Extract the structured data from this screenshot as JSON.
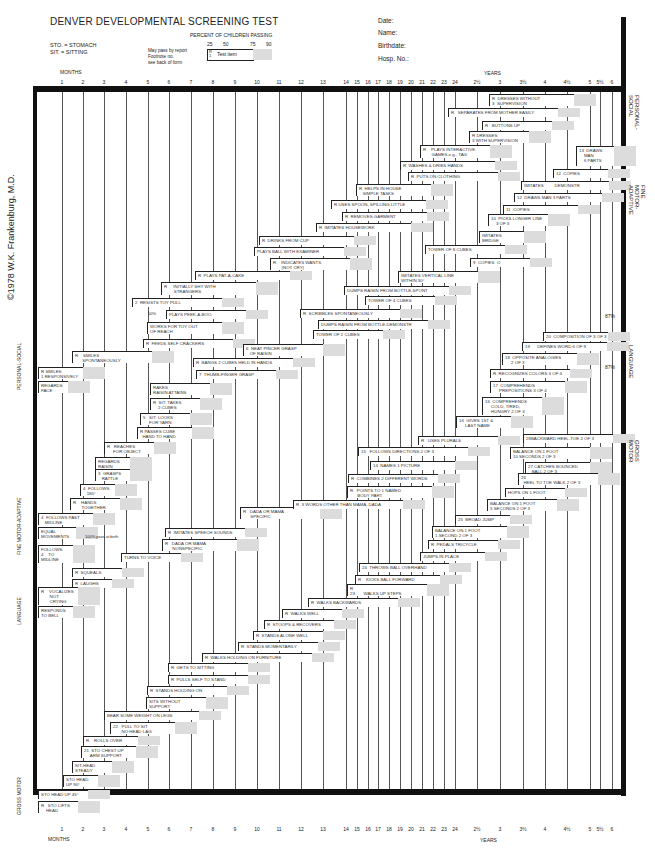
{
  "form": {
    "title": "DENVER DEVELOPMENTAL SCREENING TEST",
    "abbrev": [
      "STO. = STOMACH",
      "SIT. = SITTING"
    ],
    "percent_title": "PERCENT OF CHILDREN PASSING",
    "percent_ticks": [
      "25",
      "50",
      "75",
      "90"
    ],
    "key_notes": [
      "May pass by report",
      "Footnote no.",
      "see back of form"
    ],
    "key_label": "Test item",
    "key_r": "R",
    "key_num": "1",
    "fields": [
      "Date:",
      "Name:",
      "Birthdate:",
      "Hosp. No.:"
    ],
    "copyright": "©1978 W.K. Frankenburg, M.D."
  },
  "axis": {
    "months_label": "MONTHS",
    "years_label": "YEARS",
    "ticks": [
      {
        "label": "1",
        "x": 62
      },
      {
        "label": "2",
        "x": 83
      },
      {
        "label": "3",
        "x": 104
      },
      {
        "label": "4",
        "x": 126
      },
      {
        "label": "5",
        "x": 148
      },
      {
        "label": "6",
        "x": 169
      },
      {
        "label": "7",
        "x": 191
      },
      {
        "label": "8",
        "x": 213
      },
      {
        "label": "9",
        "x": 235
      },
      {
        "label": "10",
        "x": 257
      },
      {
        "label": "11",
        "x": 279
      },
      {
        "label": "12",
        "x": 301
      },
      {
        "label": "13",
        "x": 323
      },
      {
        "label": "14",
        "x": 346
      },
      {
        "label": "15",
        "x": 357
      },
      {
        "label": "16",
        "x": 368
      },
      {
        "label": "17",
        "x": 378
      },
      {
        "label": "18",
        "x": 389
      },
      {
        "label": "19",
        "x": 400
      },
      {
        "label": "20",
        "x": 411
      },
      {
        "label": "21",
        "x": 422
      },
      {
        "label": "22",
        "x": 433
      },
      {
        "label": "23",
        "x": 444
      },
      {
        "label": "24",
        "x": 455
      },
      {
        "label": "2½",
        "x": 477
      },
      {
        "label": "3",
        "x": 500
      },
      {
        "label": "3½",
        "x": 523
      },
      {
        "label": "4",
        "x": 545
      },
      {
        "label": "4½",
        "x": 567
      },
      {
        "label": "5",
        "x": 590
      },
      {
        "label": "5½",
        "x": 600
      },
      {
        "label": "6",
        "x": 612
      }
    ]
  },
  "sections_right": [
    "PERSONAL-SOCIAL",
    "FINE MOTOR-ADAPTIVE",
    "LANGUAGE",
    "GROSS MOTOR"
  ],
  "sections_left": [
    "PERSONAL-SOCIAL",
    "FINE MOTOR-ADAPTIVE",
    "LANGUAGE",
    "GROSS MOTOR"
  ],
  "annotations": {
    "pct87_a": "87%",
    "pct87_b": "87%",
    "pass_at_birth": "100% pass at birth",
    "fifty_pct": "50%"
  },
  "items": [
    {
      "t": "R  DRESSES WITHOUT\n3  SUPERVISION",
      "x": 489,
      "y": 94,
      "w": 85,
      "h": 12
    },
    {
      "t": "R   SEPARATES FROM MOTHER EASILY",
      "x": 448,
      "y": 108,
      "w": 110,
      "h": 9
    },
    {
      "t": "R   BUTTONS UP",
      "x": 482,
      "y": 121,
      "w": 70,
      "h": 9
    },
    {
      "t": "R DRESSES\n3 WITH SUPERVISION",
      "x": 469,
      "y": 131,
      "w": 60,
      "h": 12
    },
    {
      "t": "R    PLAYS INTERACTIVE\n       GAMES e.g., TAG",
      "x": 420,
      "y": 145,
      "w": 70,
      "h": 13
    },
    {
      "t": "R  WASHES & DRIES HANDS",
      "x": 400,
      "y": 161,
      "w": 95,
      "h": 9
    },
    {
      "t": "R  PUTS ON CLOTHING",
      "x": 408,
      "y": 172,
      "w": 90,
      "h": 9
    },
    {
      "t": "13  DRAWS\n    MAN\n    6 PARTS",
      "x": 576,
      "y": 146,
      "w": 38,
      "h": 20
    },
    {
      "t": "12  COPIES",
      "x": 553,
      "y": 169,
      "w": 55,
      "h": 9
    },
    {
      "t": "IMITATES         DEMONSTR",
      "x": 521,
      "y": 181,
      "w": 88,
      "h": 9
    },
    {
      "t": "12  DRAWS MAN 3 PARTS",
      "x": 514,
      "y": 193,
      "w": 88,
      "h": 9
    },
    {
      "t": "11  COPIES",
      "x": 503,
      "y": 205,
      "w": 75,
      "h": 9
    },
    {
      "t": "10  PICKS LONGER LINE\n    3 OF 3",
      "x": 488,
      "y": 214,
      "w": 60,
      "h": 12
    },
    {
      "t": "IMITATES\nBRIDGE",
      "x": 479,
      "y": 231,
      "w": 45,
      "h": 12
    },
    {
      "t": "TOWER OF 8 CUBES",
      "x": 425,
      "y": 245,
      "w": 80,
      "h": 9
    },
    {
      "t": "9  COPIES  O",
      "x": 470,
      "y": 258,
      "w": 60,
      "h": 9
    },
    {
      "t": "R  HELPS IN HOUSE\n   SIMPLE TASKS",
      "x": 356,
      "y": 184,
      "w": 75,
      "h": 12
    },
    {
      "t": "R USES SPOON, SPILLING LITTLE",
      "x": 331,
      "y": 200,
      "w": 95,
      "h": 9
    },
    {
      "t": "R  REMOVES GARMENT",
      "x": 342,
      "y": 212,
      "w": 85,
      "h": 9
    },
    {
      "t": "R  IMITATES HOUSEWORK",
      "x": 316,
      "y": 223,
      "w": 95,
      "h": 9
    },
    {
      "t": "R  DRINKS FROM CUP",
      "x": 259,
      "y": 236,
      "w": 95,
      "h": 9
    },
    {
      "t": "PLAYS BALL WITH EXAMINER",
      "x": 254,
      "y": 247,
      "w": 90,
      "h": 9
    },
    {
      "t": "R    INDICATES WANTS\n       (NOT CRY)",
      "x": 270,
      "y": 258,
      "w": 80,
      "h": 12
    },
    {
      "t": "IMITATES VERTICAL LINE\nWITHIN 30°",
      "x": 398,
      "y": 271,
      "w": 80,
      "h": 12
    },
    {
      "t": "DUMPS RAISIN FROM BOTTLE-SPONT",
      "x": 344,
      "y": 286,
      "w": 105,
      "h": 9
    },
    {
      "t": "TOWER OF 4 CUBES",
      "x": 365,
      "y": 296,
      "w": 70,
      "h": 9
    },
    {
      "t": "R  PLAYS PAT-A-CAKE",
      "x": 195,
      "y": 271,
      "w": 95,
      "h": 9
    },
    {
      "t": "R     INITIALLY SHY WITH\n        STRANGERS",
      "x": 161,
      "y": 282,
      "w": 95,
      "h": 13
    },
    {
      "t": "2  RESISTS TOY PULL",
      "x": 132,
      "y": 298,
      "w": 90,
      "h": 9
    },
    {
      "t": "PLAYS PEEK-A-BOO",
      "x": 166,
      "y": 310,
      "w": 80,
      "h": 9
    },
    {
      "t": "WORKS FOR TOY OUT\nOF REACH",
      "x": 147,
      "y": 322,
      "w": 75,
      "h": 12
    },
    {
      "t": "R  FEEDS SELF CRACKERS",
      "x": 143,
      "y": 339,
      "w": 90,
      "h": 9
    },
    {
      "t": "R  SCRIBBLES SPONTANEOUSLY",
      "x": 300,
      "y": 309,
      "w": 100,
      "h": 9
    },
    {
      "t": "DUMPS RAISIN FROM BOTTLE-DEMONSTR",
      "x": 318,
      "y": 320,
      "w": 110,
      "h": 9
    },
    {
      "t": "TOWER OF 2 CUBES",
      "x": 313,
      "y": 330,
      "w": 70,
      "h": 9
    },
    {
      "t": "6  NEAT PINCER GRASP\n   OF RAISIN",
      "x": 243,
      "y": 344,
      "w": 80,
      "h": 12
    },
    {
      "t": "R  BANGS 2 CUBES HELD IN HANDS",
      "x": 193,
      "y": 358,
      "w": 100,
      "h": 9
    },
    {
      "t": "7  THUMB-FINGER GRASP",
      "x": 196,
      "y": 370,
      "w": 80,
      "h": 9
    },
    {
      "t": "R    SMILES\n      SPONTANEOUSLY",
      "x": 72,
      "y": 351,
      "w": 80,
      "h": 12
    },
    {
      "t": "R SMILES\n1 RESPONSIVELY",
      "x": 38,
      "y": 367,
      "w": 45,
      "h": 12
    },
    {
      "t": "REGARDS\nFACE",
      "x": 38,
      "y": 381,
      "w": 30,
      "h": 12
    },
    {
      "t": "RAKES\nRAISIN ATTAINS",
      "x": 150,
      "y": 383,
      "w": 60,
      "h": 12
    },
    {
      "t": "R  SIT. TAKES\n    2 CUBES",
      "x": 150,
      "y": 398,
      "w": 50,
      "h": 12
    },
    {
      "t": "5   SIT. LOOKS\n     FOR YARN",
      "x": 140,
      "y": 413,
      "w": 50,
      "h": 12
    },
    {
      "t": "R PASSES CUBE\n  HAND TO HAND",
      "x": 137,
      "y": 427,
      "w": 55,
      "h": 12
    },
    {
      "t": "R   REACHES\n     FOR OBJECT",
      "x": 104,
      "y": 442,
      "w": 50,
      "h": 12
    },
    {
      "t": "REGARDS\nRAISIN",
      "x": 95,
      "y": 457,
      "w": 35,
      "h": 12
    },
    {
      "t": "3  GRASPS\n   RATTLE",
      "x": 95,
      "y": 469,
      "w": 35,
      "h": 12
    },
    {
      "t": "4  FOLLOWS\n   180°",
      "x": 80,
      "y": 484,
      "w": 35,
      "h": 12
    },
    {
      "t": "R    HANDS\n       TOGETHER",
      "x": 70,
      "y": 498,
      "w": 50,
      "h": 12
    },
    {
      "t": "4  FOLLOWS PAST\n   MIDLINE",
      "x": 38,
      "y": 513,
      "w": 55,
      "h": 12
    },
    {
      "t": "EQUAL\nMOVEMENTS",
      "x": 38,
      "y": 527,
      "w": 38,
      "h": 12
    },
    {
      "t": "FOLLOWS\n4    TO\nMIDLINE",
      "x": 38,
      "y": 545,
      "w": 35,
      "h": 18
    },
    {
      "t": "R  IMITATES SPEECH SOUNDS",
      "x": 165,
      "y": 528,
      "w": 80,
      "h": 9
    },
    {
      "t": "R   DADA OR MAMA\n      NONSPECIFIC",
      "x": 162,
      "y": 539,
      "w": 75,
      "h": 12
    },
    {
      "t": "TURNS TO VOICE",
      "x": 121,
      "y": 553,
      "w": 60,
      "h": 9
    },
    {
      "t": "R  SQUEALS",
      "x": 72,
      "y": 568,
      "w": 50,
      "h": 9
    },
    {
      "t": "R  LAUGHS",
      "x": 72,
      "y": 579,
      "w": 40,
      "h": 9
    },
    {
      "t": "R    VOCALIZES\n       NOT\n       CRYING",
      "x": 38,
      "y": 587,
      "w": 40,
      "h": 18
    },
    {
      "t": "RESPONDS\nTO BELL",
      "x": 38,
      "y": 606,
      "w": 35,
      "h": 12
    },
    {
      "t": "R   DADA OR MAMA\n      SPECIFIC",
      "x": 240,
      "y": 507,
      "w": 80,
      "h": 12
    },
    {
      "t": "R  3 WORDS OTHER THAN MAMA, DADA",
      "x": 293,
      "y": 500,
      "w": 110,
      "h": 9
    },
    {
      "t": "R   POINTS TO 1 NAMED\n      BODY PART",
      "x": 347,
      "y": 486,
      "w": 85,
      "h": 12
    },
    {
      "t": "R  COMBINES 2 DIFFERENT WORDS",
      "x": 348,
      "y": 474,
      "w": 90,
      "h": 9
    },
    {
      "t": "14  NAMES 1 PICTURE",
      "x": 370,
      "y": 461,
      "w": 85,
      "h": 9
    },
    {
      "t": "15   FOLLOWS DIRECTIONS 2 OF 3",
      "x": 358,
      "y": 447,
      "w": 110,
      "h": 9
    },
    {
      "t": "R   USES PLURALS",
      "x": 418,
      "y": 436,
      "w": 80,
      "h": 9
    },
    {
      "t": "16  GIVES 1ST &\n     LAST NAME",
      "x": 456,
      "y": 416,
      "w": 55,
      "h": 12
    },
    {
      "t": "16  COMPREHENDS\n     COLD, TIRED,\n     HUNGRY 2 OF 3",
      "x": 482,
      "y": 397,
      "w": 60,
      "h": 18
    },
    {
      "t": "17  COMPREHENDS\n     PREPOSITIONS 3 OF 4",
      "x": 490,
      "y": 381,
      "w": 75,
      "h": 12
    },
    {
      "t": "R  RECOGNIZES COLORS 3 OF 4",
      "x": 490,
      "y": 369,
      "w": 80,
      "h": 9
    },
    {
      "t": "18  OPPOSITE ANALOGIES\n     2 OF 3",
      "x": 502,
      "y": 353,
      "w": 75,
      "h": 12
    },
    {
      "t": "19      DEFINES WORD 6 OF 9",
      "x": 522,
      "y": 342,
      "w": 85,
      "h": 9
    },
    {
      "t": "20  COMPOSITION OF 3 OF 3",
      "x": 543,
      "y": 332,
      "w": 65,
      "h": 9
    },
    {
      "t": "28BACKWARD HEEL-TOE 2 OF 3",
      "x": 523,
      "y": 434,
      "w": 90,
      "h": 9
    },
    {
      "t": "BALANCE ON 1 FOOT\n10 SECONDS 2 OF 3",
      "x": 510,
      "y": 447,
      "w": 80,
      "h": 12
    },
    {
      "t": "27 CATCHES BOUNCED\n   BALL 2 OF 3",
      "x": 525,
      "y": 462,
      "w": 65,
      "h": 12
    },
    {
      "t": "26\n  HEEL TO TOE WALK 2 OF 3",
      "x": 518,
      "y": 473,
      "w": 80,
      "h": 12
    },
    {
      "t": "HOPS ON 1 FOOT",
      "x": 505,
      "y": 488,
      "w": 60,
      "h": 9
    },
    {
      "t": "BALANCE ON 1 FOOT\n5 SECONDS 2 OF 3",
      "x": 487,
      "y": 499,
      "w": 70,
      "h": 12
    },
    {
      "t": "25  BROAD JUMP",
      "x": 455,
      "y": 515,
      "w": 55,
      "h": 9
    },
    {
      "t": "BALANCE ON 1 FOOT\n1 SECOND 2 OF 3",
      "x": 432,
      "y": 526,
      "w": 75,
      "h": 12
    },
    {
      "t": "R  PEDALS TRICYCLE",
      "x": 428,
      "y": 540,
      "w": 70,
      "h": 9
    },
    {
      "t": "JUMPS IN PLACE",
      "x": 420,
      "y": 552,
      "w": 65,
      "h": 9
    },
    {
      "t": "24  THROWS BALL OVERHAND",
      "x": 359,
      "y": 563,
      "w": 90,
      "h": 9
    },
    {
      "t": "R    KICKS BALL FORWARD",
      "x": 355,
      "y": 575,
      "w": 85,
      "h": 9
    },
    {
      "t": "R\n23       WALKS UP STEPS",
      "x": 347,
      "y": 584,
      "w": 80,
      "h": 12
    },
    {
      "t": "R  WALKS BACKWARDS",
      "x": 308,
      "y": 598,
      "w": 90,
      "h": 9
    },
    {
      "t": "R  WALKS WELL",
      "x": 282,
      "y": 609,
      "w": 60,
      "h": 9
    },
    {
      "t": "R  STOOPS & RECOVERS",
      "x": 264,
      "y": 620,
      "w": 70,
      "h": 9
    },
    {
      "t": "R  STANDS ALONE WELL",
      "x": 253,
      "y": 631,
      "w": 70,
      "h": 9
    },
    {
      "t": "R  STANDS MOMENTARILY",
      "x": 238,
      "y": 642,
      "w": 80,
      "h": 9
    },
    {
      "t": "R  WALKS HOLDING ON FURNITURE",
      "x": 202,
      "y": 653,
      "w": 110,
      "h": 9
    },
    {
      "t": "R  GETS TO SITTING",
      "x": 168,
      "y": 663,
      "w": 80,
      "h": 9
    },
    {
      "t": "R  PULLS SELF TO STAND",
      "x": 168,
      "y": 675,
      "w": 80,
      "h": 9
    },
    {
      "t": "R  STANDS HOLDING ON",
      "x": 147,
      "y": 686,
      "w": 80,
      "h": 9
    },
    {
      "t": "SITS WITHOUT\nSUPPORT",
      "x": 146,
      "y": 697,
      "w": 60,
      "h": 12
    },
    {
      "t": "BEAR SOME WEIGHT ON LEGS",
      "x": 104,
      "y": 711,
      "w": 95,
      "h": 9
    },
    {
      "t": "22   PULL TO SIT\n       NO HEAD LAG",
      "x": 110,
      "y": 722,
      "w": 65,
      "h": 12
    },
    {
      "t": "R    ROLLS OVER",
      "x": 83,
      "y": 736,
      "w": 55,
      "h": 9
    },
    {
      "t": "21  STO CHEST UP\n     ARM SUPPORT",
      "x": 81,
      "y": 746,
      "w": 55,
      "h": 12
    },
    {
      "t": "SIT-HEAD\nSTEADY",
      "x": 72,
      "y": 761,
      "w": 40,
      "h": 12
    },
    {
      "t": "STO HEAD\nUP 90°",
      "x": 63,
      "y": 775,
      "w": 35,
      "h": 12
    },
    {
      "t": "STO HEAD UP 45°",
      "x": 38,
      "y": 790,
      "w": 50,
      "h": 9
    },
    {
      "t": "R   STO LIFTS\n    HEAD",
      "x": 38,
      "y": 801,
      "w": 40,
      "h": 12
    }
  ]
}
